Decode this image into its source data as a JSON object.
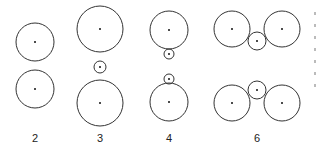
{
  "figure": {
    "stroke_color": "#333333",
    "background": "#ffffff",
    "groups": [
      {
        "label": "2",
        "label_pos": [
          35,
          142
        ],
        "circles": [
          {
            "cx": 35,
            "cy": 42,
            "r": 19
          },
          {
            "cx": 35,
            "cy": 89,
            "r": 19
          }
        ]
      },
      {
        "label": "3",
        "label_pos": [
          100,
          142
        ],
        "circles": [
          {
            "cx": 100,
            "cy": 29,
            "r": 23
          },
          {
            "cx": 100,
            "cy": 67,
            "r": 6
          },
          {
            "cx": 100,
            "cy": 103,
            "r": 23
          }
        ]
      },
      {
        "label": "4",
        "label_pos": [
          169,
          142
        ],
        "circles": [
          {
            "cx": 169,
            "cy": 30,
            "r": 19
          },
          {
            "cx": 169,
            "cy": 54,
            "r": 5
          },
          {
            "cx": 169,
            "cy": 79,
            "r": 5
          },
          {
            "cx": 169,
            "cy": 102,
            "r": 19
          }
        ]
      },
      {
        "label": "6",
        "label_pos": [
          257,
          142
        ],
        "circles": [
          {
            "cx": 232,
            "cy": 29,
            "r": 18
          },
          {
            "cx": 282,
            "cy": 29,
            "r": 18
          },
          {
            "cx": 257,
            "cy": 41,
            "r": 9
          },
          {
            "cx": 232,
            "cy": 103,
            "r": 18
          },
          {
            "cx": 282,
            "cy": 103,
            "r": 18
          },
          {
            "cx": 257,
            "cy": 90,
            "r": 9
          }
        ]
      }
    ]
  }
}
